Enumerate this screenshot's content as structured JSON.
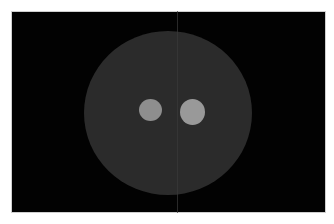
{
  "image": {
    "description": "CT phantom scan: large gray disc with two bright circular inserts on black background",
    "background_color": "#020202",
    "frame_border_color": "#cfcfcf",
    "phantom": {
      "cx": 168,
      "cy": 113,
      "rx": 84,
      "ry": 82,
      "color": "#2b2b2b"
    },
    "inserts": [
      {
        "name": "left-insert",
        "cx": 150,
        "cy": 110,
        "rx": 11.5,
        "ry": 11,
        "color": "#8e8e8e"
      },
      {
        "name": "right-insert",
        "cx": 192,
        "cy": 112,
        "rx": 12.5,
        "ry": 13,
        "color": "#999999"
      }
    ],
    "artifact_line_x": 177
  }
}
